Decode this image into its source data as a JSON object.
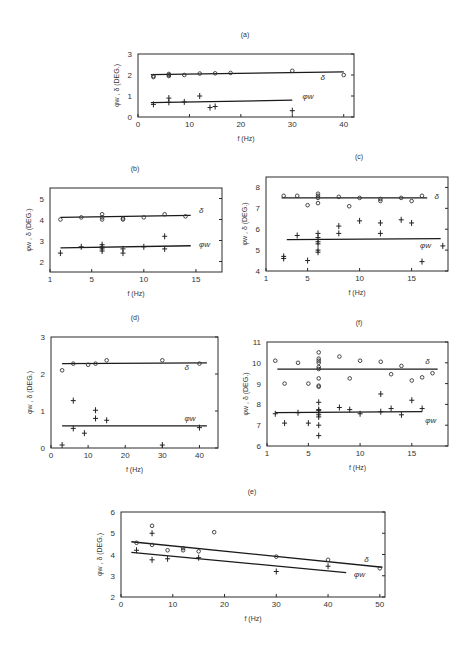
{
  "chart_data": [
    {
      "id": "a",
      "type": "scatter",
      "title": "(a)",
      "xlabel": "f (Hz)",
      "ylabel": "φw , δ  (DEG.)",
      "xlim": [
        0,
        42
      ],
      "ylim": [
        0,
        3
      ],
      "xticks": [
        0,
        10,
        20,
        30,
        40
      ],
      "yticks": [
        0,
        1,
        2,
        3
      ],
      "box": {
        "x": 138,
        "y": 54,
        "w": 216,
        "h": 63
      },
      "title_pos": [
        245,
        37
      ],
      "series": [
        {
          "name": "δ",
          "marker": "circle",
          "points": [
            [
              3,
              1.95
            ],
            [
              3,
              1.9
            ],
            [
              6,
              2.0
            ],
            [
              6,
              1.95
            ],
            [
              6,
              2.05
            ],
            [
              9,
              2.0
            ],
            [
              12,
              2.07
            ],
            [
              15,
              2.08
            ],
            [
              18,
              2.1
            ],
            [
              30,
              2.2
            ],
            [
              40,
              2.0
            ]
          ],
          "fit": [
            [
              2.5,
              2.02
            ],
            [
              40,
              2.15
            ]
          ],
          "label_pos": [
            35.5,
            1.75
          ]
        },
        {
          "name": "φw",
          "marker": "plus",
          "points": [
            [
              3,
              0.6
            ],
            [
              6,
              0.9
            ],
            [
              6,
              0.7
            ],
            [
              9,
              0.72
            ],
            [
              12,
              1.0
            ],
            [
              14,
              0.45
            ],
            [
              15,
              0.5
            ],
            [
              30,
              0.3
            ]
          ],
          "fit": [
            [
              2.5,
              0.68
            ],
            [
              30,
              0.8
            ]
          ],
          "label_pos": [
            32,
            0.85
          ]
        }
      ]
    },
    {
      "id": "b",
      "type": "scatter",
      "title": "(b)",
      "xlabel": "f (Hz)",
      "ylabel": "φw , δ  (DEG.)",
      "xlim": [
        1,
        17.5
      ],
      "ylim": [
        1.5,
        5.5
      ],
      "xticks": [
        1,
        5,
        10,
        15
      ],
      "yticks": [
        2,
        3,
        4,
        5
      ],
      "box": {
        "x": 50,
        "y": 188,
        "w": 172,
        "h": 84
      },
      "title_pos": [
        135,
        171
      ],
      "series": [
        {
          "name": "δ",
          "marker": "circle",
          "points": [
            [
              2,
              4.0
            ],
            [
              4,
              4.1
            ],
            [
              6,
              4.25
            ],
            [
              6,
              4.1
            ],
            [
              6,
              4.0
            ],
            [
              8,
              4.05
            ],
            [
              8,
              4.0
            ],
            [
              10,
              4.1
            ],
            [
              12,
              4.25
            ],
            [
              14,
              4.15
            ]
          ],
          "fit": [
            [
              2,
              4.1
            ],
            [
              14.5,
              4.2
            ]
          ],
          "label_pos": [
            15.3,
            4.3
          ]
        },
        {
          "name": "φw",
          "marker": "plus",
          "points": [
            [
              2,
              2.4
            ],
            [
              4,
              2.7
            ],
            [
              6,
              2.8
            ],
            [
              6,
              2.7
            ],
            [
              6,
              2.6
            ],
            [
              6,
              2.5
            ],
            [
              8,
              2.6
            ],
            [
              8,
              2.4
            ],
            [
              10,
              2.7
            ],
            [
              12,
              3.2
            ],
            [
              12,
              2.6
            ]
          ],
          "fit": [
            [
              2,
              2.65
            ],
            [
              14.5,
              2.75
            ]
          ],
          "label_pos": [
            15.3,
            2.7
          ]
        }
      ]
    },
    {
      "id": "c",
      "type": "scatter",
      "title": "(c)",
      "xlabel": "f (Hz)",
      "ylabel": "φw , δ  (DEG.)",
      "xlim": [
        1,
        18.5
      ],
      "ylim": [
        4,
        8.5
      ],
      "xticks": [
        1,
        5,
        10,
        15
      ],
      "yticks": [
        4,
        5,
        6,
        7,
        8
      ],
      "box": {
        "x": 266,
        "y": 177,
        "w": 182,
        "h": 94
      },
      "title_pos": [
        359,
        159
      ],
      "series": [
        {
          "name": "δ",
          "marker": "circle",
          "points": [
            [
              2.7,
              7.6
            ],
            [
              4,
              7.6
            ],
            [
              5,
              7.15
            ],
            [
              6,
              7.7
            ],
            [
              6,
              7.6
            ],
            [
              6,
              7.5
            ],
            [
              6,
              7.25
            ],
            [
              8,
              7.55
            ],
            [
              9,
              7.1
            ],
            [
              10,
              7.5
            ],
            [
              12,
              7.45
            ],
            [
              12,
              7.35
            ],
            [
              14,
              7.5
            ],
            [
              15,
              7.35
            ],
            [
              16,
              7.6
            ]
          ],
          "fit": [
            [
              2.5,
              7.5
            ],
            [
              16.5,
              7.5
            ]
          ],
          "label_pos": [
            17.2,
            7.45
          ]
        },
        {
          "name": "φw",
          "marker": "plus",
          "points": [
            [
              2.7,
              4.7
            ],
            [
              2.7,
              4.6
            ],
            [
              4,
              5.7
            ],
            [
              5,
              4.5
            ],
            [
              6,
              5.8
            ],
            [
              6,
              5.6
            ],
            [
              6,
              5.4
            ],
            [
              6,
              5.3
            ],
            [
              6,
              5.0
            ],
            [
              6,
              4.9
            ],
            [
              8,
              6.15
            ],
            [
              8,
              5.8
            ],
            [
              10,
              6.4
            ],
            [
              12,
              6.3
            ],
            [
              12,
              5.8
            ],
            [
              14,
              6.45
            ],
            [
              15,
              6.3
            ],
            [
              16,
              4.45
            ],
            [
              18,
              5.2
            ]
          ],
          "fit": [
            [
              3,
              5.5
            ],
            [
              17.8,
              5.55
            ]
          ],
          "label_pos": [
            15.8,
            5.1
          ]
        }
      ]
    },
    {
      "id": "d",
      "type": "scatter",
      "title": "(d)",
      "xlabel": "f (Hz)",
      "ylabel": "φw , δ  (DEG.)",
      "xlim": [
        0,
        45
      ],
      "ylim": [
        0,
        3
      ],
      "xticks": [
        0,
        10,
        20,
        30,
        40
      ],
      "yticks": [
        0,
        1,
        2,
        3
      ],
      "box": {
        "x": 51,
        "y": 337,
        "w": 167,
        "h": 111
      },
      "title_pos": [
        135,
        320
      ],
      "series": [
        {
          "name": "δ",
          "marker": "circle",
          "points": [
            [
              3,
              2.1
            ],
            [
              6,
              2.28
            ],
            [
              10,
              2.25
            ],
            [
              12,
              2.28
            ],
            [
              15,
              2.37
            ],
            [
              30,
              2.37
            ],
            [
              40,
              2.28
            ]
          ],
          "fit": [
            [
              3,
              2.28
            ],
            [
              42,
              2.3
            ]
          ],
          "label_pos": [
            36,
            2.1
          ]
        },
        {
          "name": "φw",
          "marker": "plus",
          "points": [
            [
              3,
              0.08
            ],
            [
              6,
              1.28
            ],
            [
              6,
              0.53
            ],
            [
              9,
              0.4
            ],
            [
              12,
              1.02
            ],
            [
              12,
              0.8
            ],
            [
              15,
              0.75
            ],
            [
              30,
              0.08
            ],
            [
              40,
              0.55
            ]
          ],
          "fit": [
            [
              3,
              0.6
            ],
            [
              42,
              0.6
            ]
          ],
          "label_pos": [
            36,
            0.72
          ]
        }
      ]
    },
    {
      "id": "f",
      "type": "scatter",
      "title": "(f)",
      "xlabel": "f (Hz)",
      "ylabel": "φw , δ  (DEG.)",
      "xlim": [
        1,
        18.5
      ],
      "ylim": [
        6,
        11
      ],
      "xticks": [
        1,
        5,
        10,
        15
      ],
      "yticks": [
        6,
        7,
        8,
        9,
        10,
        11
      ],
      "box": {
        "x": 267,
        "y": 342,
        "w": 181,
        "h": 104
      },
      "title_pos": [
        359,
        325
      ],
      "series": [
        {
          "name": "δ",
          "marker": "circle",
          "points": [
            [
              1.8,
              10.1
            ],
            [
              2.7,
              9.0
            ],
            [
              4,
              10.0
            ],
            [
              5,
              9.0
            ],
            [
              6,
              10.5
            ],
            [
              6,
              10.2
            ],
            [
              6,
              10.1
            ],
            [
              6,
              10.0
            ],
            [
              6,
              9.8
            ],
            [
              6,
              9.7
            ],
            [
              6,
              9.25
            ],
            [
              6,
              8.9
            ],
            [
              6,
              8.85
            ],
            [
              8,
              10.3
            ],
            [
              9,
              9.25
            ],
            [
              10,
              10.1
            ],
            [
              12,
              10.05
            ],
            [
              13,
              9.45
            ],
            [
              14,
              9.85
            ],
            [
              15,
              9.15
            ],
            [
              16,
              9.3
            ],
            [
              17,
              9.5
            ]
          ],
          "fit": [
            [
              2,
              9.7
            ],
            [
              17.5,
              9.7
            ]
          ],
          "label_pos": [
            16.3,
            9.95
          ]
        },
        {
          "name": "φw",
          "marker": "plus",
          "points": [
            [
              1.8,
              7.55
            ],
            [
              2.7,
              7.1
            ],
            [
              4,
              7.6
            ],
            [
              5,
              7.1
            ],
            [
              6,
              8.1
            ],
            [
              6,
              7.75
            ],
            [
              6,
              7.7
            ],
            [
              6,
              7.6
            ],
            [
              6,
              7.5
            ],
            [
              6,
              7.4
            ],
            [
              6,
              7.0
            ],
            [
              6,
              6.5
            ],
            [
              8,
              7.85
            ],
            [
              9,
              7.75
            ],
            [
              10,
              7.55
            ],
            [
              12,
              8.5
            ],
            [
              12,
              7.65
            ],
            [
              13,
              7.8
            ],
            [
              14,
              7.5
            ],
            [
              15,
              8.2
            ],
            [
              16,
              7.8
            ]
          ],
          "fit": [
            [
              1.8,
              7.6
            ],
            [
              16,
              7.65
            ]
          ],
          "label_pos": [
            16.3,
            7.1
          ]
        }
      ]
    },
    {
      "id": "e",
      "type": "scatter",
      "title": "(e)",
      "xlabel": "f (Hz)",
      "ylabel": "φw , δ  (DEG.)",
      "xlim": [
        0,
        51
      ],
      "ylim": [
        2,
        6
      ],
      "xticks": [
        0,
        10,
        20,
        30,
        40,
        50
      ],
      "yticks": [
        2,
        3,
        4,
        5,
        6
      ],
      "box": {
        "x": 121,
        "y": 512,
        "w": 264,
        "h": 85
      },
      "title_pos": [
        252,
        494
      ],
      "series": [
        {
          "name": "δ",
          "marker": "circle",
          "points": [
            [
              3,
              4.55
            ],
            [
              6,
              5.35
            ],
            [
              6,
              4.45
            ],
            [
              9,
              4.2
            ],
            [
              12,
              4.3
            ],
            [
              12,
              4.2
            ],
            [
              15,
              4.15
            ],
            [
              18,
              5.05
            ],
            [
              30,
              3.9
            ],
            [
              40,
              3.75
            ],
            [
              50,
              3.35
            ]
          ],
          "fit": [
            [
              2,
              4.6
            ],
            [
              50.5,
              3.4
            ]
          ],
          "label_pos": [
            47,
            3.65
          ]
        },
        {
          "name": "φw",
          "marker": "plus",
          "points": [
            [
              3,
              4.2
            ],
            [
              6,
              5.0
            ],
            [
              6,
              3.75
            ],
            [
              9,
              3.8
            ],
            [
              15,
              3.85
            ],
            [
              30,
              3.2
            ],
            [
              40,
              3.45
            ]
          ],
          "fit": [
            [
              2,
              4.1
            ],
            [
              43.5,
              3.15
            ]
          ],
          "label_pos": [
            45,
            2.95
          ]
        }
      ]
    }
  ]
}
